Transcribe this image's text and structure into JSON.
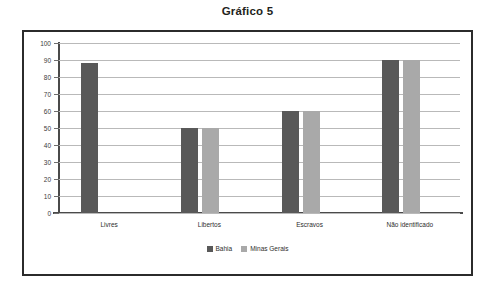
{
  "chart_data": {
    "type": "bar",
    "title": "Gráfico 5",
    "xlabel": "",
    "ylabel": "",
    "categories": [
      "Livres",
      "Libertos",
      "Escravos",
      "Não identificado"
    ],
    "series": [
      {
        "name": "Bahia",
        "color": "#595959",
        "values": [
          88,
          50,
          60,
          90
        ]
      },
      {
        "name": "Minas Gerais",
        "color": "#a9a9a9",
        "values": [
          null,
          50,
          60,
          90
        ]
      }
    ],
    "ylim": [
      0,
      100
    ],
    "yticks": [
      0,
      10,
      20,
      30,
      40,
      50,
      60,
      70,
      80,
      90,
      100
    ],
    "ytick_labels": [
      "0",
      "10",
      "20",
      "30",
      "40",
      "50",
      "60",
      "70",
      "80",
      "90",
      "100"
    ],
    "grid": true,
    "legend_position": "bottom"
  },
  "frame": {
    "border_color": "#2b2b2b"
  }
}
